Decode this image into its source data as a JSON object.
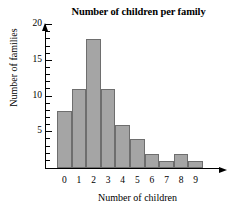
{
  "chart_data": {
    "type": "bar",
    "title": "Number of children per family",
    "xlabel": "Number of children",
    "ylabel": "Number of families",
    "categories": [
      "0",
      "1",
      "2",
      "3",
      "4",
      "5",
      "6",
      "7",
      "8",
      "9"
    ],
    "values": [
      8,
      11,
      18,
      11,
      6,
      4,
      2,
      1,
      2,
      1
    ],
    "ylim": [
      0,
      21
    ],
    "ytick_labels": [
      "5",
      "10",
      "15",
      "20"
    ],
    "ytick_values": [
      5,
      10,
      15,
      20
    ],
    "ytick_minor_step": 1,
    "grid": false,
    "legend": "none",
    "bar_fill_color": "#a5a5a5",
    "bar_border_color": "#6e6e6e",
    "axis_color": "#000000"
  }
}
